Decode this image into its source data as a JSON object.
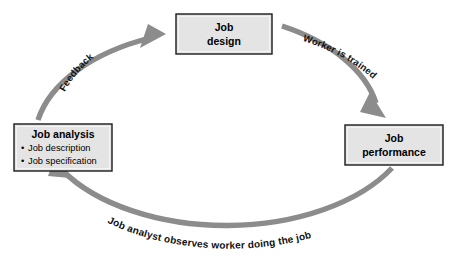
{
  "diagram": {
    "type": "cycle-flow",
    "background_color": "#ffffff",
    "arc_color": "#8c8c8c",
    "box_fill_color": "#e4e4e4",
    "box_border_color": "#1a1a1a",
    "text_color": "#000000",
    "boxes": [
      {
        "id": "job-design",
        "title": "Job",
        "subtitle": "design",
        "bullets": []
      },
      {
        "id": "job-performance",
        "title": "Job",
        "subtitle": "performance",
        "bullets": []
      },
      {
        "id": "job-analysis",
        "title": "Job analysis",
        "subtitle": "",
        "bullets": [
          "Job description",
          "Job specification"
        ]
      }
    ],
    "arrows": [
      {
        "id": "worker-is-trained",
        "label": "Worker is trained",
        "from": "job-design",
        "to": "job-performance"
      },
      {
        "id": "job-analyst-observes",
        "label": "Job analyst observes worker doing the job",
        "from": "job-performance",
        "to": "job-analysis"
      },
      {
        "id": "feedback",
        "label": "Feedback",
        "from": "job-analysis",
        "to": "job-design"
      }
    ],
    "bullet_glyph": "•"
  }
}
